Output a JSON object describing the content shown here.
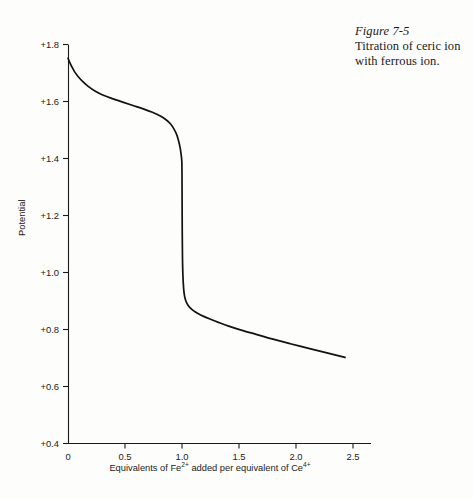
{
  "caption": {
    "figure_number": "Figure 7-5",
    "text": "Titration of ceric ion with ferrous ion."
  },
  "chart_data": {
    "type": "line",
    "title": "",
    "xlabel": "Equivalents of Fe2+ added per equivalent of Ce4+",
    "xlabel_parts": {
      "pre": "Equivalents of Fe",
      "sup1": "2+",
      "mid": " added per equivalent of Ce",
      "sup2": "4+"
    },
    "ylabel": "Potential",
    "xlim": [
      0,
      2.6
    ],
    "ylim": [
      0.4,
      1.8
    ],
    "xticks": [
      0,
      0.5,
      1.0,
      1.5,
      2.0,
      2.5
    ],
    "xtick_labels": [
      "0",
      "0.5",
      "1.0",
      "1.5",
      "2.0",
      "2.5"
    ],
    "yticks": [
      0.4,
      0.6,
      0.8,
      1.0,
      1.2,
      1.4,
      1.6,
      1.8
    ],
    "ytick_labels": [
      "+0.4",
      "+0.6",
      "+0.8",
      "+1.0",
      "+1.2",
      "+1.4",
      "+1.6",
      "+1.8"
    ],
    "grid": false,
    "legend": null,
    "line_color": "#111111",
    "line_width": 1.7,
    "equivalence_point": 1.0,
    "series": [
      {
        "name": "Titration curve",
        "x": [
          0.0,
          0.02,
          0.04,
          0.06,
          0.09,
          0.13,
          0.18,
          0.24,
          0.31,
          0.39,
          0.48,
          0.57,
          0.66,
          0.74,
          0.81,
          0.86,
          0.9,
          0.93,
          0.955,
          0.972,
          0.984,
          0.991,
          0.996,
          0.998,
          0.999,
          1.0,
          1.001,
          1.002,
          1.004,
          1.008,
          1.014,
          1.022,
          1.034,
          1.05,
          1.072,
          1.1,
          1.14,
          1.19,
          1.25,
          1.32,
          1.41,
          1.52,
          1.65,
          1.79,
          1.95,
          2.12,
          2.28,
          2.43
        ],
        "y": [
          1.752,
          1.733,
          1.717,
          1.703,
          1.687,
          1.67,
          1.652,
          1.636,
          1.622,
          1.61,
          1.598,
          1.586,
          1.574,
          1.562,
          1.549,
          1.536,
          1.521,
          1.503,
          1.482,
          1.459,
          1.437,
          1.418,
          1.402,
          1.392,
          1.38,
          1.34,
          1.25,
          1.15,
          1.06,
          0.99,
          0.945,
          0.918,
          0.9,
          0.887,
          0.876,
          0.866,
          0.856,
          0.846,
          0.836,
          0.825,
          0.812,
          0.798,
          0.783,
          0.767,
          0.75,
          0.733,
          0.717,
          0.702
        ]
      }
    ]
  },
  "axes": {
    "y_axis_name": "potential-axis",
    "x_axis_name": "equivalents-axis"
  }
}
